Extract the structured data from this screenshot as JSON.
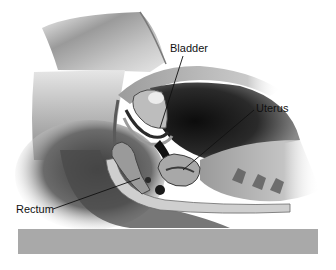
{
  "figure": {
    "type": "anatomical-illustration",
    "view": "sagittal cross-section of pelvis, patient lying on side",
    "colors": {
      "background": "#ffffff",
      "base_bar": "#a9a9a9",
      "leader_line": "#111111",
      "label_text": "#111111"
    }
  },
  "labels": [
    {
      "id": "bladder",
      "text": "Bladder",
      "x": 170,
      "y": 42
    },
    {
      "id": "uterus",
      "text": "Uterus",
      "x": 256,
      "y": 102
    },
    {
      "id": "rectum",
      "text": "Rectum",
      "x": 16,
      "y": 203
    }
  ],
  "base_bar": {
    "x": 18,
    "y": 229,
    "width": 300,
    "height": 25
  }
}
